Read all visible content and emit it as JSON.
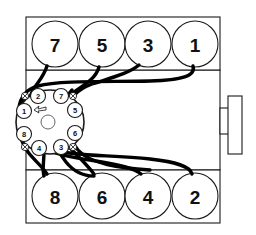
{
  "diagram": {
    "engine_type": "V8",
    "firing_order": "1-8-4-3-6-5-7-2",
    "line_color": "#000000",
    "block_fill": "#ffffff",
    "caption": ""
  },
  "cylinder_banks": {
    "top_bank": {
      "name": "left-cylinder-bank",
      "cylinders": [
        {
          "number": "7",
          "cx": 55,
          "cy": 44
        },
        {
          "number": "5",
          "cx": 102,
          "cy": 44
        },
        {
          "number": "3",
          "cx": 148,
          "cy": 44
        },
        {
          "number": "1",
          "cx": 195,
          "cy": 44
        }
      ]
    },
    "bottom_bank": {
      "name": "right-cylinder-bank",
      "cylinders": [
        {
          "number": "8",
          "cx": 55,
          "cy": 196
        },
        {
          "number": "6",
          "cx": 102,
          "cy": 196
        },
        {
          "number": "4",
          "cx": 148,
          "cy": 196
        },
        {
          "number": "2",
          "cx": 195,
          "cy": 196
        }
      ]
    }
  },
  "distributor": {
    "name": "distributor-cap",
    "center_x": 50,
    "center_y": 122,
    "rotation_note": "counterclockwise",
    "terminals": [
      {
        "post": "2",
        "cx": 38,
        "cy": 96
      },
      {
        "post": "7",
        "cx": 61,
        "cy": 96
      },
      {
        "post": "1",
        "cx": 24,
        "cy": 111
      },
      {
        "post": "5",
        "cx": 75,
        "cy": 110
      },
      {
        "post": "8",
        "cx": 24,
        "cy": 134
      },
      {
        "post": "6",
        "cx": 75,
        "cy": 133
      },
      {
        "post": "4",
        "cx": 39,
        "cy": 148
      },
      {
        "post": "3",
        "cx": 61,
        "cy": 147
      }
    ],
    "clips": [
      {
        "name": "clip-upper-left",
        "cx": 25,
        "cy": 96
      },
      {
        "name": "clip-upper-right",
        "cx": 73,
        "cy": 96
      },
      {
        "name": "clip-lower-left",
        "cx": 25,
        "cy": 147
      },
      {
        "name": "clip-lower-right",
        "cx": 73,
        "cy": 147
      }
    ]
  },
  "components": {
    "crank_pulley": {
      "name": "crankshaft-pulley",
      "x": 228,
      "y": 96,
      "w": 14,
      "h": 58
    },
    "rotor_hub": {
      "name": "rotor-hub",
      "cx": 48,
      "cy": 122,
      "r": 7
    },
    "rotation_arrow": {
      "name": "rotation-arrow",
      "cx": 41,
      "cy": 110
    }
  },
  "legend": {
    "top_row_label": "Left bank cylinders 7 5 3 1",
    "bottom_row_label": "Right bank cylinders 8 6 4 2",
    "distributor_label": "Distributor cap terminals"
  }
}
